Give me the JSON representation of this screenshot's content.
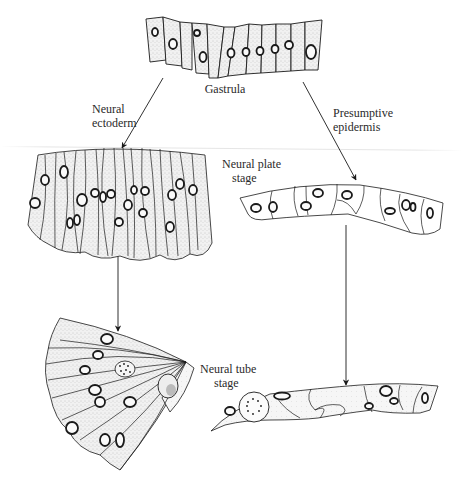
{
  "figure": {
    "stages": {
      "gastrula": {
        "label": "Gastrula",
        "nuclei_count": 12
      },
      "neural_ectoderm": {
        "label_line1": "Neural",
        "label_line2": "ectoderm"
      },
      "presumptive_epidermis": {
        "label_line1": "Presumptive",
        "label_line2": "epidermis"
      },
      "neural_plate": {
        "label_line1": "Neural plate",
        "label_line2": "stage"
      },
      "neural_tube": {
        "label_line1": "Neural tube",
        "label_line2": "stage"
      }
    },
    "arrows": [
      {
        "from": "gastrula",
        "to": "neural_plate_stage",
        "via": "Neural ectoderm"
      },
      {
        "from": "gastrula",
        "to": "epidermis_plate_stage",
        "via": "Presumptive epidermis"
      },
      {
        "from": "neural_plate_stage",
        "to": "neural_tube_stage"
      },
      {
        "from": "epidermis_plate_stage",
        "to": "epidermis_tube_stage"
      }
    ],
    "colors": {
      "ink": "#1a1a1a",
      "cell_fill": "#e9e9e9",
      "cell_stipple": "#bdbdbd",
      "background": "#ffffff"
    }
  }
}
